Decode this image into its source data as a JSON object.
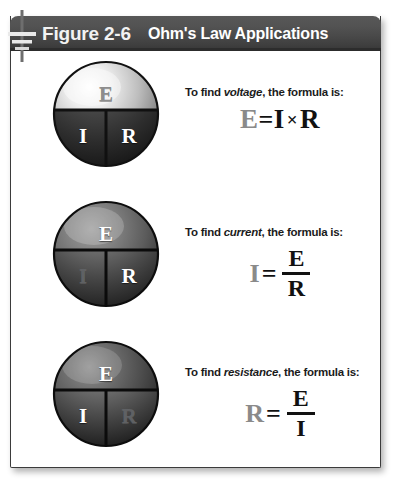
{
  "figure": {
    "label": "Figure 2-6",
    "title": "Ohm's Law Applications",
    "ground_icon": "ground-icon"
  },
  "colors": {
    "header_dark": "#4a4a4a",
    "header_edge": "#2c2c2c",
    "panel_border": "#3b3b3b",
    "text_light": "#ffffff",
    "unknown_gray": "#8a8a8a",
    "formula_black": "#111111"
  },
  "rows": [
    {
      "id": "voltage",
      "sphere": {
        "name": "ohms-law-wheel-voltage",
        "top_letter": "E",
        "bottom_left_letter": "I",
        "bottom_right_letter": "R",
        "unknown": "E"
      },
      "caption_prefix": "To find ",
      "caption_term": "voltage",
      "caption_suffix": ", the formula is:",
      "formula": {
        "kind": "inline",
        "lhs": "E",
        "equals": "=",
        "operand_a": "I",
        "operator": "×",
        "operand_b": "R"
      }
    },
    {
      "id": "current",
      "sphere": {
        "name": "ohms-law-wheel-current",
        "top_letter": "E",
        "bottom_left_letter": "I",
        "bottom_right_letter": "R",
        "unknown": "I"
      },
      "caption_prefix": "To find ",
      "caption_term": "current",
      "caption_suffix": ", the formula is:",
      "formula": {
        "kind": "fraction",
        "lhs": "I",
        "equals": "=",
        "numerator": "E",
        "denominator": "R"
      }
    },
    {
      "id": "resistance",
      "sphere": {
        "name": "ohms-law-wheel-resistance",
        "top_letter": "E",
        "bottom_left_letter": "I",
        "bottom_right_letter": "R",
        "unknown": "R"
      },
      "caption_prefix": "To find ",
      "caption_term": "resistance",
      "caption_suffix": ", the formula is:",
      "formula": {
        "kind": "fraction",
        "lhs": "R",
        "equals": "=",
        "numerator": "E",
        "denominator": "I"
      }
    }
  ]
}
